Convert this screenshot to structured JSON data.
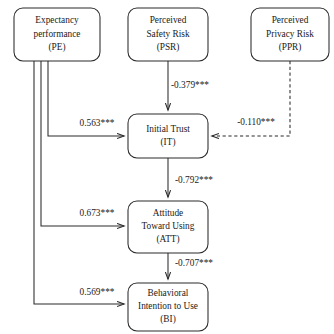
{
  "diagram": {
    "type": "structural-equation-path-model",
    "colors": {
      "stroke": "#2b2b2b",
      "text": "#1a1a1a",
      "background": "#ffffff"
    },
    "nodes": [
      {
        "id": "PE",
        "lines": [
          "Expectancy",
          "performance",
          "(PE)"
        ],
        "x": 14,
        "y": 8,
        "w": 86,
        "h": 53
      },
      {
        "id": "PSR",
        "lines": [
          "Perceived",
          "Safety Risk",
          "(PSR)"
        ],
        "x": 128,
        "y": 8,
        "w": 80,
        "h": 53
      },
      {
        "id": "PPR",
        "lines": [
          "Perceived",
          "Privacy Risk",
          "(PPR)"
        ],
        "x": 251,
        "y": 8,
        "w": 78,
        "h": 53
      },
      {
        "id": "IT",
        "lines": [
          "Initial Trust",
          "(IT)"
        ],
        "x": 128,
        "y": 114,
        "w": 80,
        "h": 44
      },
      {
        "id": "ATT",
        "lines": [
          "Attitude",
          "Toward Using",
          "(ATT)"
        ],
        "x": 128,
        "y": 201,
        "w": 80,
        "h": 52
      },
      {
        "id": "BI",
        "lines": [
          "Behavioral",
          "Intention to Use",
          "(BI)"
        ],
        "x": 128,
        "y": 283,
        "w": 80,
        "h": 48
      }
    ],
    "paths": [
      {
        "id": "psr-to-it",
        "from": "PSR",
        "to": "IT",
        "coefficient": "-0.379***",
        "style": "solid",
        "label_x": 190,
        "label_y": 88,
        "d": "M 168,61 L 168,110"
      },
      {
        "id": "pe-to-it",
        "from": "PE",
        "to": "IT",
        "coefficient": "0.563***",
        "style": "solid",
        "label_x": 97,
        "label_y": 126,
        "d": "M 48,61 L 48,136 L 124,136"
      },
      {
        "id": "ppr-to-it",
        "from": "PPR",
        "to": "IT",
        "coefficient": "-0.110***",
        "style": "dashed",
        "label_x": 256,
        "label_y": 125,
        "d": "M 290,61 L 290,136 L 212,136"
      },
      {
        "id": "it-to-att",
        "from": "IT",
        "to": "ATT",
        "coefficient": "-0.792***",
        "style": "solid",
        "label_x": 194,
        "label_y": 183,
        "d": "M 168,158 L 168,197"
      },
      {
        "id": "pe-to-att",
        "from": "PE",
        "to": "ATT",
        "coefficient": "0.673***",
        "style": "solid",
        "label_x": 97,
        "label_y": 216,
        "d": "M 41,61 L 41,226 L 124,226"
      },
      {
        "id": "att-to-bi",
        "from": "ATT",
        "to": "BI",
        "coefficient": "-0.707***",
        "style": "solid",
        "label_x": 194,
        "label_y": 266,
        "d": "M 168,253 L 168,279"
      },
      {
        "id": "pe-to-bi",
        "from": "PE",
        "to": "BI",
        "coefficient": "0.569***",
        "style": "solid",
        "label_x": 97,
        "label_y": 295,
        "d": "M 34,61 L 34,304 L 124,304"
      }
    ]
  }
}
